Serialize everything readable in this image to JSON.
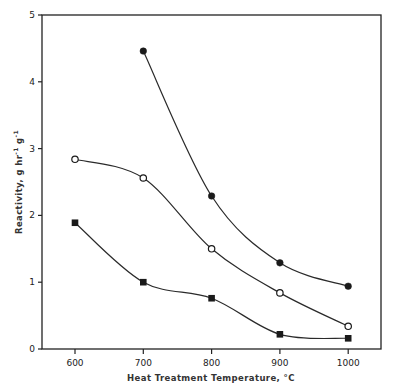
{
  "chart_data": {
    "type": "scatter",
    "title": "",
    "xlabel": "Heat Treatment Temperature, °C",
    "ylabel": "Reactivity, g  hr⁻¹ g⁻¹",
    "xlim": [
      551,
      1049
    ],
    "ylim": [
      0,
      5
    ],
    "x_ticks": [
      600,
      700,
      800,
      900,
      1000
    ],
    "y_ticks": [
      0,
      1,
      2,
      3,
      4,
      5
    ],
    "grid": false,
    "legend": null,
    "smooth_curves": true,
    "series": [
      {
        "name": "filled-circles",
        "marker": "filled-circle",
        "x": [
          700,
          800,
          900,
          1000
        ],
        "values": [
          4.46,
          2.29,
          1.29,
          0.94
        ]
      },
      {
        "name": "open-circles",
        "marker": "open-circle",
        "x": [
          600,
          700,
          800,
          900,
          1000
        ],
        "values": [
          2.84,
          2.56,
          1.5,
          0.84,
          0.34
        ]
      },
      {
        "name": "filled-squares",
        "marker": "filled-square",
        "x": [
          600,
          700,
          800,
          900,
          1000
        ],
        "values": [
          1.89,
          1.0,
          0.76,
          0.22,
          0.16
        ]
      }
    ]
  },
  "axes": {
    "x_title": "Heat Treatment Temperature, °C",
    "y_title_main": "Reactivity, g  hr",
    "y_title_sup1": "-1",
    "y_title_mid": " g",
    "y_title_sup2": "-1",
    "x_tick_labels": [
      "600",
      "700",
      "800",
      "900",
      "1000"
    ],
    "y_tick_labels": [
      "0",
      "1",
      "2",
      "3",
      "4",
      "5"
    ]
  },
  "colors": {
    "ink": "#222222",
    "background": "#ffffff"
  }
}
